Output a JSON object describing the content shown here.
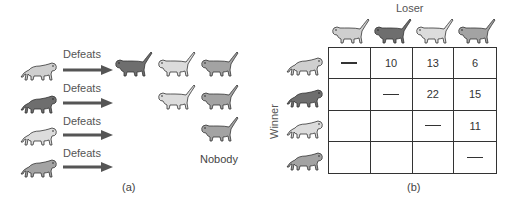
{
  "colors": {
    "monkey_light": "#cfcfcf",
    "monkey_dark": "#6e6e6e",
    "monkey_pale": "#dcdcdc",
    "monkey_mid": "#a3a3a3",
    "outline": "#333333",
    "arrow": "#555555",
    "grid": "#333333"
  },
  "panel_a": {
    "caption": "(a)",
    "rows": [
      {
        "winner": "light",
        "label": "Defeats",
        "defeated": [
          "dark",
          "pale",
          "mid"
        ]
      },
      {
        "winner": "dark",
        "label": "Defeats",
        "defeated": [
          "pale",
          "mid"
        ]
      },
      {
        "winner": "pale",
        "label": "Defeats",
        "defeated": [
          "mid"
        ]
      },
      {
        "winner": "mid",
        "label": "Defeats",
        "defeated": [],
        "nobody_label": "Nobody"
      }
    ]
  },
  "panel_b": {
    "caption": "(b)",
    "column_axis_label": "Loser",
    "row_axis_label": "Winner",
    "columns": [
      "light",
      "dark",
      "pale",
      "mid"
    ],
    "rows": [
      "light",
      "dark",
      "pale",
      "mid"
    ],
    "matrix": [
      [
        "—",
        "10",
        "13",
        "6"
      ],
      [
        "",
        "—",
        "22",
        "15"
      ],
      [
        "",
        "",
        "—",
        "11"
      ],
      [
        "",
        "",
        "",
        "—"
      ]
    ]
  }
}
